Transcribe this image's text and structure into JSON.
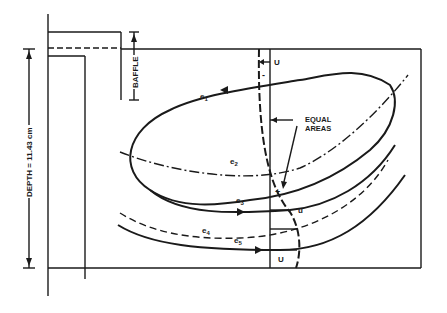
{
  "diagram": {
    "labels": {
      "baffle": "BAFFLE",
      "depth": "DEPTH = 11.43 cm",
      "equal_areas_line1": "EQUAL",
      "equal_areas_line2": "AREAS",
      "u_top": "U",
      "u_mid": "u",
      "u_bottom": "U",
      "minus": "-",
      "plus": "+"
    },
    "streamlines": [
      {
        "id": "e1",
        "label": "e",
        "sub": "1",
        "style": "solid"
      },
      {
        "id": "e2",
        "label": "e",
        "sub": "2",
        "style": "dash-dot"
      },
      {
        "id": "e3",
        "label": "e",
        "sub": "3",
        "style": "solid"
      },
      {
        "id": "e4",
        "label": "e",
        "sub": "4",
        "style": "dashed"
      },
      {
        "id": "e5",
        "label": "e",
        "sub": "5",
        "style": "solid"
      }
    ],
    "colors": {
      "ink": "#1a1a1a",
      "background": "#ffffff"
    }
  }
}
